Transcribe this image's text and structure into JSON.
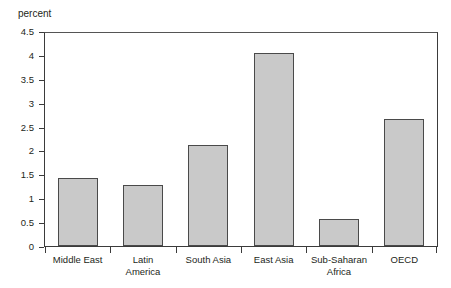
{
  "chart_data": {
    "type": "bar",
    "title": "",
    "xlabel": "",
    "ylabel": "percent",
    "ylim": [
      0,
      4.5
    ],
    "grid": false,
    "legend": null,
    "categories": [
      "Middle East",
      "Latin\nAmerica",
      "South Asia",
      "East Asia",
      "Sub-Saharan\nAfrica",
      "OECD"
    ],
    "values": [
      1.43,
      1.28,
      2.11,
      4.05,
      0.56,
      2.66
    ],
    "ytick_labels": [
      "0",
      "0.5",
      "1",
      "1.5",
      "2",
      "2.5",
      "3",
      "3.5",
      "4",
      "4.5"
    ],
    "ytick_values": [
      0,
      0.5,
      1,
      1.5,
      2,
      2.5,
      3,
      3.5,
      4,
      4.5
    ],
    "colors": {
      "bar_fill": "#c9c9c9",
      "bar_border": "#4a4a4a",
      "axis": "#3b3b3b",
      "text": "#231f20",
      "background": "#ffffff"
    }
  }
}
